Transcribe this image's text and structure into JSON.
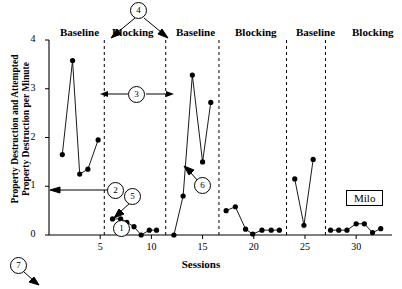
{
  "chart_data": {
    "type": "line",
    "title": "",
    "subject_label": "Milo",
    "xlabel": "Sessions",
    "ylabel": "Property Destruction and Attempted Property Destruction per Minute",
    "ylabel_line1": "Property Destruction and Attempted",
    "ylabel_line2": "Property Destruction per Minute",
    "xlim": [
      0,
      33.5
    ],
    "ylim": [
      0,
      4
    ],
    "xticks": [
      5,
      10,
      15,
      20,
      25,
      30
    ],
    "yticks": [
      0,
      1,
      2,
      3,
      4
    ],
    "grid": false,
    "legend": "none",
    "phase_labels": [
      "Baseline",
      "Blocking",
      "Baseline",
      "Blocking",
      "Baseline",
      "Blocking"
    ],
    "phase_boundaries": [
      5.4,
      11.4,
      16.6,
      23.2,
      27.0
    ],
    "series": [
      {
        "name": "Baseline 1",
        "points": [
          [
            1.3,
            1.65
          ],
          [
            2.3,
            3.58
          ],
          [
            3.0,
            1.25
          ],
          [
            3.8,
            1.35
          ],
          [
            4.8,
            1.95
          ]
        ]
      },
      {
        "name": "Blocking 1",
        "points": [
          [
            6.2,
            0.33
          ],
          [
            7.0,
            0.33
          ],
          [
            7.6,
            0.26
          ],
          [
            8.3,
            0.17
          ],
          [
            9.0,
            0.0
          ],
          [
            9.8,
            0.1
          ],
          [
            10.5,
            0.1
          ]
        ]
      },
      {
        "name": "Baseline 2",
        "points": [
          [
            12.2,
            0.0
          ],
          [
            13.1,
            0.8
          ],
          [
            14.0,
            3.28
          ],
          [
            15.0,
            1.5
          ],
          [
            15.8,
            2.72
          ]
        ]
      },
      {
        "name": "Blocking 2",
        "points": [
          [
            17.3,
            0.5
          ],
          [
            18.2,
            0.58
          ],
          [
            19.2,
            0.12
          ],
          [
            19.9,
            0.02
          ],
          [
            20.8,
            0.1
          ],
          [
            21.7,
            0.1
          ],
          [
            22.5,
            0.1
          ]
        ]
      },
      {
        "name": "Baseline 3",
        "points": [
          [
            24.0,
            1.15
          ],
          [
            24.9,
            0.2
          ],
          [
            25.8,
            1.55
          ]
        ]
      },
      {
        "name": "Blocking 3",
        "points": [
          [
            27.5,
            0.1
          ],
          [
            28.3,
            0.1
          ],
          [
            29.1,
            0.1
          ],
          [
            30.0,
            0.23
          ],
          [
            30.8,
            0.23
          ],
          [
            31.6,
            0.05
          ],
          [
            32.4,
            0.13
          ]
        ]
      }
    ],
    "callouts": [
      {
        "id": "1",
        "label": "1",
        "cx": 121,
        "cy": 228,
        "target": "x-axis-line"
      },
      {
        "id": "2",
        "label": "2",
        "cx": 115,
        "cy": 190,
        "target": "y-axis-line"
      },
      {
        "id": "3",
        "label": "3",
        "cx": 136,
        "cy": 94,
        "target": "phase-width-arrow"
      },
      {
        "id": "4",
        "label": "4",
        "cx": 138,
        "cy": 10,
        "target": "phase-change-lines"
      },
      {
        "id": "5",
        "label": "5",
        "cx": 132,
        "cy": 196,
        "target": "data-path"
      },
      {
        "id": "6",
        "label": "6",
        "cx": 202,
        "cy": 185,
        "target": "data-path"
      },
      {
        "id": "7",
        "label": "7",
        "cx": 18,
        "cy": 265,
        "target": "figure-caption"
      }
    ]
  }
}
